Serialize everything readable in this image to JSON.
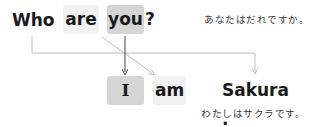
{
  "question": {
    "words": [
      {
        "text": "Who",
        "style": "plain"
      },
      {
        "text": "are",
        "style": "light-box"
      },
      {
        "text": "you",
        "style": "dark-box"
      },
      {
        "text": "?",
        "style": "plain"
      }
    ],
    "translation": "あなたはだれですか。"
  },
  "answer": {
    "words": [
      {
        "text": "I",
        "style": "dark-box"
      },
      {
        "text": "am",
        "style": "light-box"
      },
      {
        "text": "Sakura .",
        "style": "plain"
      }
    ],
    "translation": "わたしはサクラです。"
  },
  "connectors": [
    {
      "from": "Who",
      "to": "Sakura .",
      "type": "elbow-arrow"
    },
    {
      "from": "you",
      "to": "I",
      "type": "vertical-arrow"
    },
    {
      "from": "are",
      "to": "am",
      "type": "diagonal-arrow"
    }
  ],
  "colors": {
    "light_box": "#f1f1f1",
    "dark_box": "#d5d5d5",
    "line": "#bdbdbd",
    "dark_line": "#444444"
  }
}
